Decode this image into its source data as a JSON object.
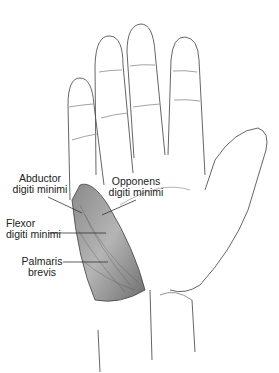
{
  "figure": {
    "labels": [
      {
        "line1": "Abductor",
        "line2": "digiti minimi"
      },
      {
        "line1": "Opponens",
        "line2": "digiti minimi"
      },
      {
        "line1": "Flexor",
        "line2": "digiti minimi"
      },
      {
        "line1": "Palmaris",
        "line2": "brevis"
      }
    ]
  }
}
